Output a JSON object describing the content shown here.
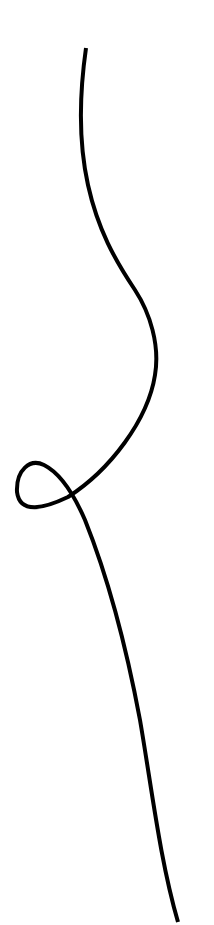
{
  "canvas": {
    "width": 214,
    "height": 925,
    "background": "#ffffff"
  },
  "drawing": {
    "description": "single continuous hand-drawn line with a small loop",
    "stroke_color": "#000000",
    "stroke_width": 4,
    "path": "M86,48 C80,90 78,140 88,185 C98,230 115,260 135,290 C150,313 160,345 155,375 C148,420 110,470 68,497 C45,508 20,515 17,492 C16,470 30,458 44,465 C58,472 72,490 85,520 C105,570 125,640 140,720 C152,790 160,860 178,922"
  }
}
